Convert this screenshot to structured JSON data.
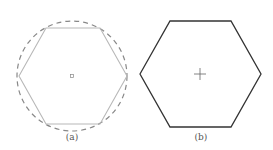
{
  "figure": {
    "panels": [
      {
        "id": "a",
        "label": "(a)",
        "shape": "regular-hexagon",
        "orientation": "flat-top",
        "hexagon_style": "thin-light-gray-solid",
        "circumscribed_circle": "dashed",
        "center_marker": "small-square"
      },
      {
        "id": "b",
        "label": "(b)",
        "shape": "regular-hexagon",
        "orientation": "flat-top",
        "hexagon_style": "dark-solid",
        "center_marker": "crosshair"
      }
    ],
    "colors": {
      "hexagon_a": "#b8b8b8",
      "circle_a": "#888888",
      "hexagon_b": "#333333",
      "center_mark": "#666666",
      "label": "#555555"
    }
  }
}
